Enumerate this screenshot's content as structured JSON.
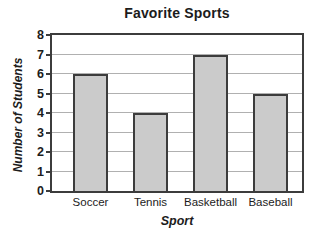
{
  "chart_data": {
    "type": "bar",
    "title": "Favorite Sports",
    "xlabel": "Sport",
    "ylabel": "Number of Students",
    "categories": [
      "Soccer",
      "Tennis",
      "Basketball",
      "Baseball"
    ],
    "values": [
      6,
      4,
      7,
      5
    ],
    "ylim": [
      0,
      8
    ],
    "yticks": [
      0,
      1,
      2,
      3,
      4,
      5,
      6,
      7,
      8
    ],
    "grid": "horizontal",
    "legend": "none",
    "colors": {
      "background": "#ffffff",
      "text": "#1c1c1c",
      "axis": "#3c3c3c",
      "gridline": "#b0b0b0",
      "bar_fill": "#cbcbcb",
      "bar_border": "#3c3c3c"
    }
  }
}
